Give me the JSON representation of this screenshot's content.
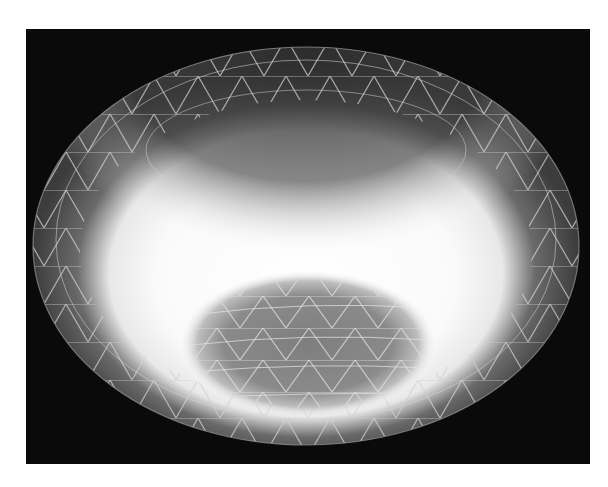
{
  "figure": {
    "type": "rendered-3d-surface",
    "background_color": "#0a0a0a",
    "page_color": "#ffffff",
    "frame": {
      "x": 26,
      "y": 29,
      "width": 564,
      "height": 435
    },
    "bowl": {
      "center_x": 306,
      "center_y": 246,
      "rx": 273,
      "ry": 199,
      "rim_color": "#3a3a3a",
      "highlight_color": "#ffffff",
      "inner_spot": {
        "center_x": 308,
        "center_y": 344,
        "rx": 122,
        "ry": 67,
        "color": "#808080"
      }
    },
    "mesh": {
      "line_color": "#d8d8d8",
      "style": "triangulated"
    }
  }
}
